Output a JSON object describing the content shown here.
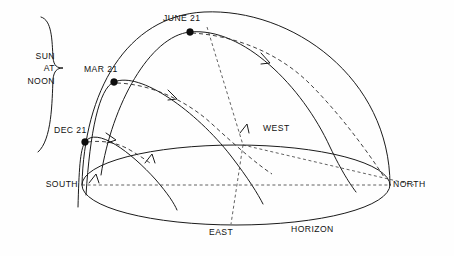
{
  "figure": {
    "background_color": "#ffffff",
    "line_color": "#1b1b1b"
  },
  "labels": {
    "sun_at_noon_line1": "SUN",
    "sun_at_noon_line2": "AT",
    "sun_at_noon_line3": "NOON",
    "june": "JUNE 21",
    "march": "MAR 21",
    "december": "DEC 21",
    "west": "WEST",
    "north": "NORTH",
    "south": "SOUTH",
    "east": "EAST",
    "horizon": "HORIZON"
  },
  "cardinal_points": [
    {
      "name": "SOUTH",
      "x": 82,
      "y": 185
    },
    {
      "name": "NORTH",
      "x": 390,
      "y": 185
    },
    {
      "name": "EAST",
      "x": 231,
      "y": 225
    },
    {
      "name": "WEST",
      "x": 241,
      "y": 145
    }
  ],
  "sun_positions": [
    {
      "name": "JUNE 21",
      "x": 190,
      "y": 32,
      "marker": "filled-dot"
    },
    {
      "name": "MAR 21",
      "x": 114,
      "y": 82,
      "marker": "filled-dot"
    },
    {
      "name": "DEC 21",
      "x": 85,
      "y": 142,
      "marker": "filled-dot"
    }
  ],
  "geometry": {
    "horizon_ellipse": {
      "cx": 236,
      "cy": 185,
      "rx": 154,
      "ry": 40
    },
    "dome_meridian": "S(82,185) over zenith to N(390,185)",
    "noon_bracket": {
      "top_x": 48,
      "top_y": 17,
      "bottom_x": 48,
      "bottom_y": 152,
      "tip_x": 63,
      "tip_y": 68
    }
  },
  "legend": {
    "solid_lines": "Sun's daily path (solid arcs)",
    "dashed_lines": "Declination / reference lines (dashed arcs)",
    "arrow_meaning": "direction of apparent motion"
  }
}
